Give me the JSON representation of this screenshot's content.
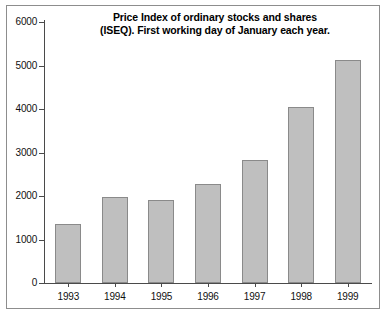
{
  "chart_data": {
    "type": "bar",
    "title": "Price Index of ordinary stocks and shares (ISEQ). First working day of January each year.",
    "title_lines": [
      "Price Index of ordinary stocks and shares",
      "(ISEQ). First working day of January each year."
    ],
    "categories": [
      "1993",
      "1994",
      "1995",
      "1996",
      "1997",
      "1998",
      "1999"
    ],
    "values": [
      1350,
      1975,
      1910,
      2280,
      2830,
      4040,
      5130
    ],
    "series": [
      {
        "name": "ISEQ Price Index",
        "values": [
          1350,
          1975,
          1910,
          2280,
          2830,
          4040,
          5130
        ]
      }
    ],
    "xlabel": "",
    "ylabel": "",
    "ylim": [
      0,
      6000
    ],
    "ytick_values": [
      0,
      1000,
      2000,
      3000,
      4000,
      5000,
      6000
    ],
    "ytick_labels": [
      "0",
      "1000",
      "2000",
      "3000",
      "4000",
      "5000",
      "6000"
    ],
    "grid": false,
    "legend": false,
    "legend_position": "none",
    "bar_color": "#bfbfbf",
    "bar_edge_color": "#8a8a8a",
    "axis_color": "#4a4a4a",
    "background_color": "#ffffff",
    "frame_color": "#8d8d8d",
    "text_color": "#000000"
  }
}
